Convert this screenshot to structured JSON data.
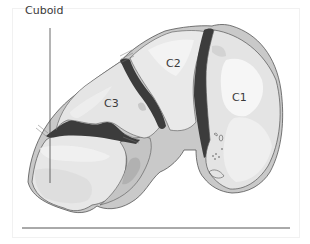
{
  "figure": {
    "type": "anatomical cross-section illustration",
    "labels": {
      "cuboid": "Cuboid",
      "c1": "C1",
      "c2": "C2",
      "c3": "C3"
    },
    "colors": {
      "bone_light": "#e9e9e9",
      "bone_mid": "#d2d2d2",
      "bone_highlight": "#f4f4f4",
      "joint_dark": "#3c3c3c",
      "cortex_gray": "#b9b9b9",
      "outline": "#555555",
      "baseline": "#555555"
    }
  }
}
